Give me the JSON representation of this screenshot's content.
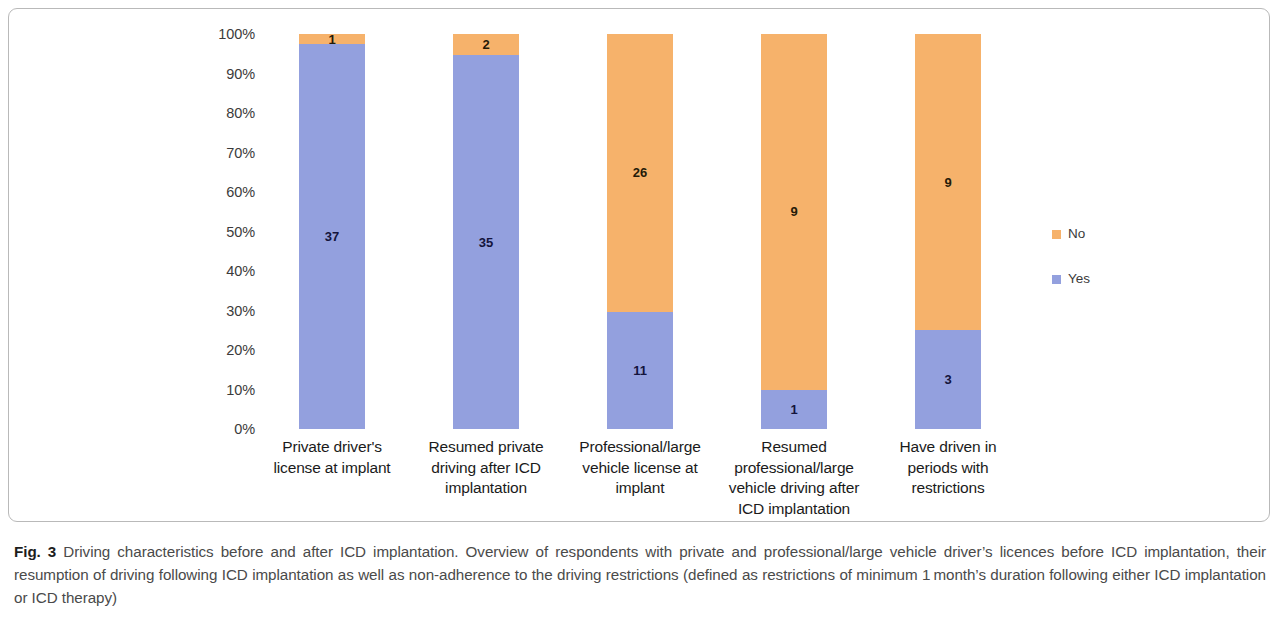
{
  "figure": {
    "caption_label": "Fig. 3",
    "caption_text": " Driving characteristics before and after ICD implantation. Overview of respondents with private and professional/large vehicle driver’s licences before ICD implantation, their resumption of driving following ICD implantation as well as non-adherence to the driving restrictions (defined as restrictions of minimum 1 month’s duration following either ICD implantation or ICD therapy)"
  },
  "colors": {
    "no": "#f6b26b",
    "yes": "#93a0de",
    "frame": "#b9b9b9",
    "axis_text": "#3b3b3b",
    "label_text": "#14143c"
  },
  "legend": {
    "position": "right",
    "entries": [
      {
        "label": "No",
        "color": "#f6b26b"
      },
      {
        "label": "Yes",
        "color": "#93a0de"
      }
    ]
  },
  "chart_data": {
    "type": "bar",
    "subtype": "stacked-100-percent",
    "title": "",
    "xlabel": "",
    "ylabel": "",
    "ylim": [
      0,
      100
    ],
    "grid": false,
    "ytick_labels": [
      "100%",
      "90%",
      "80%",
      "70%",
      "60%",
      "50%",
      "40%",
      "30%",
      "20%",
      "10%",
      "0%"
    ],
    "ytick_values": [
      100,
      90,
      80,
      70,
      60,
      50,
      40,
      30,
      20,
      10,
      0
    ],
    "categories": [
      "Private driver's license at implant",
      "Resumed private driving after ICD implantation",
      "Professional/large vehicle license at implant",
      "Resumed professional/large vehicle driving after ICD implantation",
      "Have driven in periods with restrictions"
    ],
    "category_lines": [
      [
        "Private driver's",
        "license at implant"
      ],
      [
        "Resumed private",
        "driving after ICD",
        "implantation"
      ],
      [
        "Professional/large",
        "vehicle license at",
        "implant"
      ],
      [
        "Resumed",
        "professional/large",
        "vehicle driving after",
        "ICD implantation"
      ],
      [
        "Have driven in",
        "periods with",
        "restrictions"
      ]
    ],
    "series": [
      {
        "name": "No",
        "color": "#f6b26b",
        "values": [
          1,
          2,
          26,
          9,
          9
        ],
        "percents": [
          2.6,
          5.4,
          70.3,
          90.0,
          75.0
        ]
      },
      {
        "name": "Yes",
        "color": "#93a0de",
        "values": [
          37,
          35,
          11,
          1,
          3
        ],
        "percents": [
          97.4,
          94.6,
          29.7,
          10.0,
          25.0
        ]
      }
    ]
  }
}
